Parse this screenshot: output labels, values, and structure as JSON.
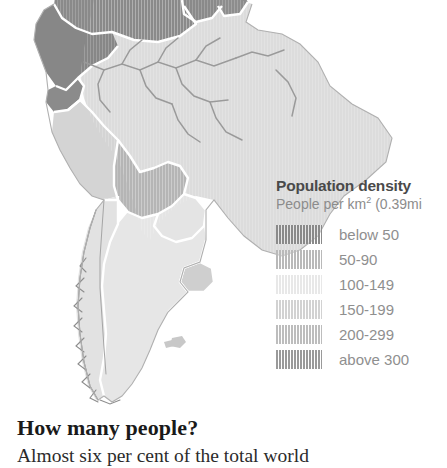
{
  "map": {
    "name": "south-america-population-density-map",
    "region": "South America",
    "ocean_color": "#ffffff",
    "border_color": "#ffffff",
    "river_color": "#9a9a9a",
    "coast_color": "#8d8d8d",
    "countries": [
      {
        "name": "Colombia",
        "density_class": "below 50",
        "fill": "#8a8a8a"
      },
      {
        "name": "Venezuela",
        "density_class": "below 50",
        "fill": "#8a8a8a"
      },
      {
        "name": "Ecuador",
        "density_class": "below 50",
        "fill": "#878787"
      },
      {
        "name": "Guyana",
        "density_class": "below 50",
        "fill": "#8a8a8a"
      },
      {
        "name": "Suriname",
        "density_class": "below 50",
        "fill": "#8a8a8a"
      },
      {
        "name": "Peru",
        "density_class": "150-199",
        "fill": "#d4d4d4"
      },
      {
        "name": "Brazil",
        "density_class": "100-149",
        "fill": "#dcdcdc"
      },
      {
        "name": "Bolivia",
        "density_class": "200-299",
        "fill": "#b5b5b5"
      },
      {
        "name": "Paraguay",
        "density_class": "100-149",
        "fill": "#e4e4e4"
      },
      {
        "name": "Chile",
        "density_class": "100-149",
        "fill": "#e2e2e2"
      },
      {
        "name": "Argentina",
        "density_class": "100-149",
        "fill": "#e6e6e6"
      },
      {
        "name": "Uruguay",
        "density_class": "150-199",
        "fill": "#cfcfcf"
      }
    ]
  },
  "legend": {
    "title": "Population density",
    "subtitle_prefix": "People per km",
    "subtitle_suffix": " (0.39mi",
    "subtitle_sup": "2",
    "items": [
      {
        "label": "below 50",
        "color": "#8a8a8a"
      },
      {
        "label": "50-90",
        "color": "#b9b9b9"
      },
      {
        "label": "100-149",
        "color": "#e8e8e8"
      },
      {
        "label": "150-199",
        "color": "#d2d2d2"
      },
      {
        "label": "200-299",
        "color": "#bdbdbd"
      },
      {
        "label": "above 300",
        "color": "#9a9a9a"
      }
    ]
  },
  "article": {
    "heading": "How many people?",
    "body_line": "Almost six per cent of the total world"
  }
}
